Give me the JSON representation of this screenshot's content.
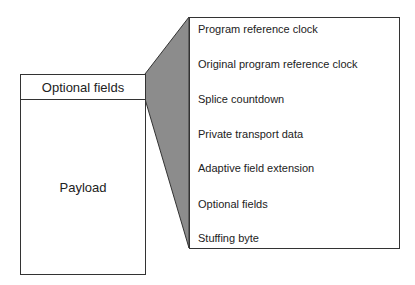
{
  "diagram": {
    "packet": {
      "header_label": "Optional fields",
      "body_label": "Payload"
    },
    "expanded_fields": [
      "Program reference clock",
      "Original program reference clock",
      "Splice countdown",
      "Private transport data",
      "Adaptive field extension",
      "Optional fields",
      "Stuffing byte"
    ],
    "colors": {
      "wedge": "#8c8c8c",
      "border": "#333333"
    }
  }
}
